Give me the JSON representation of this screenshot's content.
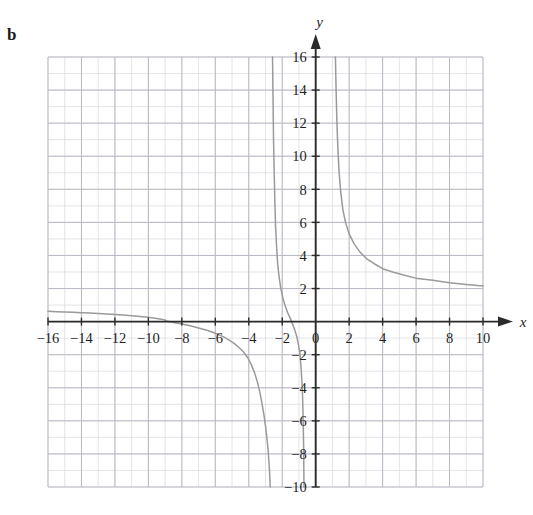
{
  "figure": {
    "part_label": "b",
    "background": "#ffffff"
  },
  "chart_data": {
    "type": "line",
    "title": "",
    "subtitle": "",
    "xlabel": "x",
    "ylabel": "y",
    "xlim": [
      -17,
      11
    ],
    "ylim": [
      -11,
      17
    ],
    "xticks": [
      -16,
      -14,
      -12,
      -10,
      -8,
      -6,
      -4,
      -2,
      0,
      2,
      4,
      6,
      8,
      10
    ],
    "yticks": [
      -10,
      -8,
      -6,
      -4,
      -2,
      2,
      4,
      6,
      8,
      10,
      12,
      14,
      16
    ],
    "xtick_labels": [
      "-16",
      "-14",
      "-12",
      "-10",
      "-8",
      "-6",
      "-4",
      "-2",
      "0",
      "2",
      "4",
      "6",
      "8",
      "10"
    ],
    "ytick_labels": [
      "-10",
      "-8",
      "-6",
      "-4",
      "-2",
      "2",
      "4",
      "6",
      "8",
      "10",
      "12",
      "14",
      "16"
    ],
    "grid": true,
    "grid_major_step": 2,
    "grid_minor_step": 1,
    "grid_color": "#b9b9c4",
    "grid_minor_color": "#d8d8e0",
    "axis_color": "#2b2b2b",
    "curve_color": "#9a9a9a",
    "legend": null,
    "annotations": [],
    "asymptotes": {
      "horizontal": [
        2
      ],
      "vertical": [
        1,
        -2.6
      ]
    },
    "series": [
      {
        "name": "branch-right",
        "comment": "Right branch: descends from y=16 near x=1.2 toward horizontal asymptote y=2",
        "points": [
          [
            1.18,
            16.0
          ],
          [
            1.22,
            14.0
          ],
          [
            1.27,
            12.0
          ],
          [
            1.33,
            10.4
          ],
          [
            1.4,
            9.0
          ],
          [
            1.5,
            7.8
          ],
          [
            1.62,
            6.8
          ],
          [
            1.78,
            6.0
          ],
          [
            2.0,
            5.3
          ],
          [
            2.3,
            4.7
          ],
          [
            2.65,
            4.2
          ],
          [
            3.05,
            3.8
          ],
          [
            3.5,
            3.5
          ],
          [
            4.0,
            3.2
          ],
          [
            4.6,
            3.0
          ],
          [
            5.3,
            2.8
          ],
          [
            6.1,
            2.6
          ],
          [
            7.0,
            2.5
          ],
          [
            8.0,
            2.35
          ],
          [
            9.0,
            2.25
          ],
          [
            10.0,
            2.15
          ]
        ]
      },
      {
        "name": "branch-middle",
        "comment": "Middle branch: from x-axis near x=-9 descending through x-intercept ~-4.5 then plunging to y=-10 near x=-2.6",
        "points": [
          [
            -9.0,
            0.05
          ],
          [
            -8.5,
            -0.05
          ],
          [
            -8.0,
            -0.15
          ],
          [
            -7.5,
            -0.25
          ],
          [
            -7.0,
            -0.38
          ],
          [
            -6.5,
            -0.52
          ],
          [
            -6.0,
            -0.7
          ],
          [
            -5.5,
            -0.92
          ],
          [
            -5.2,
            -1.1
          ],
          [
            -4.9,
            -1.3
          ],
          [
            -4.6,
            -1.55
          ],
          [
            -4.3,
            -1.85
          ],
          [
            -4.05,
            -2.2
          ],
          [
            -3.85,
            -2.6
          ],
          [
            -3.65,
            -3.1
          ],
          [
            -3.5,
            -3.6
          ],
          [
            -3.35,
            -4.2
          ],
          [
            -3.22,
            -4.9
          ],
          [
            -3.1,
            -5.6
          ],
          [
            -3.0,
            -6.3
          ],
          [
            -2.92,
            -7.0
          ],
          [
            -2.85,
            -7.7
          ],
          [
            -2.8,
            -8.4
          ],
          [
            -2.75,
            -9.2
          ],
          [
            -2.72,
            -10.0
          ]
        ]
      },
      {
        "name": "branch-upper-middle",
        "comment": "Steep branch descending from y=16 near x=-2.45 down to the x-axis region near x=-2.2",
        "points": [
          [
            -2.58,
            16.0
          ],
          [
            -2.55,
            13.5
          ],
          [
            -2.52,
            11.0
          ],
          [
            -2.48,
            9.0
          ],
          [
            -2.44,
            7.2
          ],
          [
            -2.4,
            5.8
          ],
          [
            -2.34,
            4.6
          ],
          [
            -2.28,
            3.6
          ],
          [
            -2.2,
            2.8
          ],
          [
            -2.1,
            2.1
          ],
          [
            -1.98,
            1.5
          ],
          [
            -1.84,
            1.0
          ],
          [
            -1.68,
            0.55
          ],
          [
            -1.5,
            0.15
          ],
          [
            -1.38,
            -0.15
          ],
          [
            -1.25,
            -0.5
          ],
          [
            -1.12,
            -0.95
          ],
          [
            -1.02,
            -1.45
          ],
          [
            -0.94,
            -2.0
          ],
          [
            -0.88,
            -2.7
          ],
          [
            -0.83,
            -3.5
          ],
          [
            -0.79,
            -4.4
          ],
          [
            -0.76,
            -5.4
          ],
          [
            -0.74,
            -6.5
          ],
          [
            -0.72,
            -7.6
          ],
          [
            -0.71,
            -8.8
          ],
          [
            -0.7,
            -10.0
          ]
        ]
      },
      {
        "name": "branch-far-left",
        "comment": "Far-left branch lying just above the x-axis, from x=-16 to about x=-9",
        "points": [
          [
            -16.0,
            0.62
          ],
          [
            -15.5,
            0.6
          ],
          [
            -15.0,
            0.58
          ],
          [
            -14.5,
            0.56
          ],
          [
            -14.0,
            0.54
          ],
          [
            -13.5,
            0.52
          ],
          [
            -13.0,
            0.49
          ],
          [
            -12.5,
            0.46
          ],
          [
            -12.0,
            0.43
          ],
          [
            -11.5,
            0.4
          ],
          [
            -11.0,
            0.36
          ],
          [
            -10.5,
            0.31
          ],
          [
            -10.0,
            0.26
          ],
          [
            -9.6,
            0.21
          ],
          [
            -9.3,
            0.16
          ],
          [
            -9.1,
            0.12
          ],
          [
            -9.0,
            0.1
          ]
        ]
      }
    ]
  }
}
